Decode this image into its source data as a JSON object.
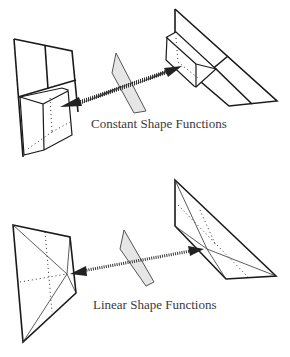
{
  "figure": {
    "top": {
      "caption": "Constant Shape Functions",
      "description": "Two boundary element panels with constant (box) shape functions connected by a dotted double-headed arrow through a shaded plane"
    },
    "bottom": {
      "caption": "Linear Shape Functions",
      "description": "Two boundary element panels with linear (pyramid) shape functions connected by a dotted double-headed arrow through a shaded plane"
    },
    "colors": {
      "line": "#1a1a1a",
      "plane_fill": "#e6e6e6",
      "arrow": "#222222",
      "caption": "#3a3a3a"
    }
  }
}
